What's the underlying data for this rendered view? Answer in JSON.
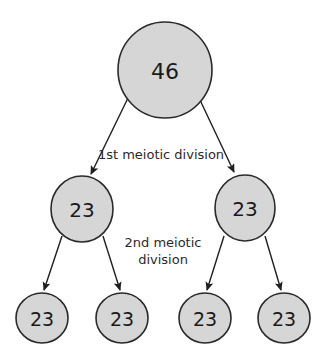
{
  "diagram": {
    "colors": {
      "node_fill": "#d6d6d6",
      "node_stroke": "#2a2a2a",
      "arrow": "#1f1f1f",
      "text": "#1a1a1a"
    },
    "nodes": {
      "parent": {
        "label": "46"
      },
      "middle_left": {
        "label": "23"
      },
      "middle_right": {
        "label": "23"
      },
      "bottom_1": {
        "label": "23"
      },
      "bottom_2": {
        "label": "23"
      },
      "bottom_3": {
        "label": "23"
      },
      "bottom_4": {
        "label": "23"
      }
    },
    "captions": {
      "first_division": "1st meiotic division",
      "second_division_line1": "2nd meiotic",
      "second_division_line2": "division"
    },
    "edges": [
      {
        "from": "parent",
        "to": "middle_left"
      },
      {
        "from": "parent",
        "to": "middle_right"
      },
      {
        "from": "middle_left",
        "to": "bottom_1"
      },
      {
        "from": "middle_left",
        "to": "bottom_2"
      },
      {
        "from": "middle_right",
        "to": "bottom_3"
      },
      {
        "from": "middle_right",
        "to": "bottom_4"
      }
    ]
  }
}
